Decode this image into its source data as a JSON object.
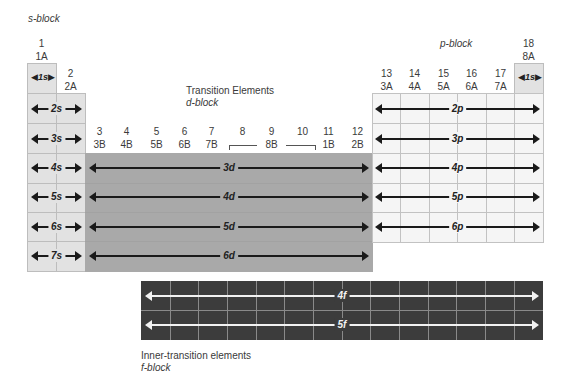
{
  "labels": {
    "s_block": "s-block",
    "p_block": "p-block",
    "transition_title": "Transition Elements",
    "d_block": "d-block",
    "inner_transition_title": "Inner-transition elements",
    "f_block": "f-block"
  },
  "groups": {
    "g1": {
      "num": "1",
      "sub": "1A"
    },
    "g2": {
      "num": "2",
      "sub": "2A"
    },
    "g3": {
      "num": "3",
      "sub": "3B"
    },
    "g4": {
      "num": "4",
      "sub": "4B"
    },
    "g5": {
      "num": "5",
      "sub": "5B"
    },
    "g6": {
      "num": "6",
      "sub": "6B"
    },
    "g7": {
      "num": "7",
      "sub": "7B"
    },
    "g8": {
      "num": "8"
    },
    "g9": {
      "num": "9"
    },
    "g10": {
      "num": "10"
    },
    "g8b": {
      "sub": "8B"
    },
    "g11": {
      "num": "11",
      "sub": "1B"
    },
    "g12": {
      "num": "12",
      "sub": "2B"
    },
    "g13": {
      "num": "13",
      "sub": "3A"
    },
    "g14": {
      "num": "14",
      "sub": "4A"
    },
    "g15": {
      "num": "15",
      "sub": "5A"
    },
    "g16": {
      "num": "16",
      "sub": "6A"
    },
    "g17": {
      "num": "17",
      "sub": "7A"
    },
    "g18": {
      "num": "18",
      "sub": "8A"
    }
  },
  "orbitals": {
    "s": [
      "1s",
      "2s",
      "3s",
      "4s",
      "5s",
      "6s",
      "7s"
    ],
    "he": "1s",
    "d": [
      "3d",
      "4d",
      "5d",
      "6d"
    ],
    "p": [
      "2p",
      "3p",
      "4p",
      "5p",
      "6p"
    ],
    "f": [
      "4f",
      "5f"
    ]
  },
  "colors": {
    "s_block": "#e2e2e2",
    "p_block": "#f5f5f5",
    "d_block": "#a9a9a9",
    "f_block": "#3c3c3c"
  }
}
